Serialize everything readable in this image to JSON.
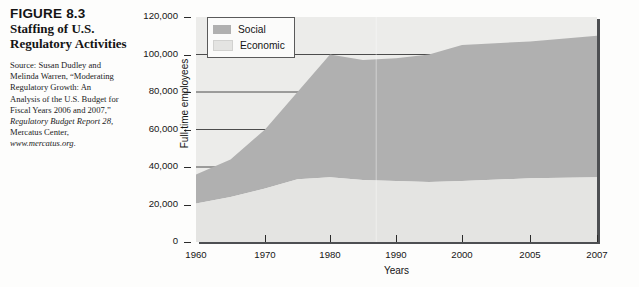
{
  "figure": {
    "number": "FIGURE 8.3",
    "title": "Staffing of U.S. Regulatory Activities",
    "source_lines": [
      "Source: Susan Dudley and",
      "Melinda Warren, “Moderating",
      "Regulatory Growth: An",
      "Analysis of the U.S. Budget for",
      "Fiscal Years 2006 and 2007,”"
    ],
    "source_italic_1": "Regulatory Budget Report 28,",
    "source_line_6": "Mercatus Center,",
    "source_italic_2": "www.mercatus.org."
  },
  "colors": {
    "social": "#b0b0b0",
    "economic": "#e4e4e2",
    "plot_background": "#ececea",
    "gridline": "#3a3a3a",
    "axis": "#4d4f52"
  },
  "chart_data": {
    "type": "area",
    "title": "Staffing of U.S. Regulatory Activities",
    "xlabel": "Years",
    "ylabel": "Full-time employees",
    "stacked": true,
    "grid": true,
    "legend_position": "top-left",
    "xlim": [
      1960,
      2007
    ],
    "ylim": [
      0,
      120000
    ],
    "yticks": [
      0,
      20000,
      40000,
      60000,
      80000,
      100000,
      120000
    ],
    "ytick_labels": [
      "0",
      "20,000",
      "40,000",
      "60,000",
      "80,000",
      "100,000",
      "120,000"
    ],
    "xticks": [
      1960,
      1970,
      1980,
      1990,
      2000,
      2005,
      2007
    ],
    "xtick_labels": [
      "1960",
      "1970",
      "1980",
      "1990",
      "2000",
      "2005",
      "2007"
    ],
    "x": [
      1960,
      1965,
      1970,
      1975,
      1980,
      1985,
      1990,
      1995,
      2000,
      2005,
      2007
    ],
    "series": [
      {
        "name": "Economic",
        "values": [
          20500,
          24000,
          28500,
          33500,
          34500,
          33000,
          32500,
          32000,
          32500,
          34000,
          34500
        ]
      },
      {
        "name": "Social",
        "values": [
          15500,
          20000,
          31500,
          46500,
          65500,
          64000,
          65500,
          68000,
          72500,
          73000,
          75500
        ]
      }
    ],
    "totals": [
      36000,
      44000,
      60000,
      80000,
      100000,
      97000,
      98000,
      100000,
      105000,
      107000,
      110000
    ]
  },
  "legend": {
    "items": [
      {
        "label": "Social",
        "color": "#b0b0b0"
      },
      {
        "label": "Economic",
        "color": "#e4e4e2"
      }
    ]
  }
}
